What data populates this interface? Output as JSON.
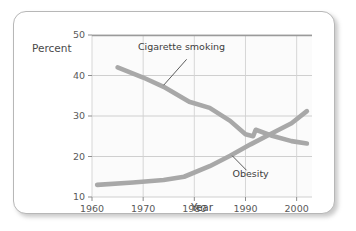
{
  "chart_data": {
    "type": "line",
    "title": "",
    "xlabel": "Year",
    "ylabel": "Percent",
    "xlim": [
      1960,
      2003
    ],
    "ylim": [
      10,
      50
    ],
    "xticks": [
      1960,
      1970,
      1980,
      1990,
      2000
    ],
    "yticks": [
      10,
      20,
      30,
      40,
      50
    ],
    "xtick_labels": [
      "1960",
      "1970",
      "1980",
      "1990",
      "2000"
    ],
    "ytick_labels": [
      "10",
      "20",
      "30",
      "40",
      "50"
    ],
    "grid": true,
    "legend_position": "inline-annotations",
    "line_color": "#a8a8a8",
    "series": [
      {
        "name": "Cigarette smoking",
        "label": "Cigarette smoking",
        "x": [
          1965,
          1970,
          1974,
          1979,
          1983,
          1987,
          1990,
          1991.5,
          1992,
          1995,
          1999,
          2002
        ],
        "values": [
          42.0,
          39.5,
          37.2,
          33.5,
          32.0,
          28.8,
          25.5,
          25.0,
          26.6,
          25.2,
          23.8,
          23.2
        ]
      },
      {
        "name": "Obesity",
        "label": "Obesity",
        "x": [
          1961,
          1968,
          1974,
          1978,
          1983,
          1987,
          1991,
          1995,
          1999,
          2002
        ],
        "values": [
          13.0,
          13.6,
          14.2,
          15.0,
          17.6,
          20.2,
          23.0,
          25.6,
          28.2,
          31.2
        ]
      }
    ],
    "annotations": [
      {
        "text": "Cigarette smoking",
        "label_x": 1977.5,
        "label_y": 46.2,
        "leader_from": [
          1978.5,
          44.0
        ],
        "leader_to": [
          1974.0,
          37.6
        ]
      },
      {
        "text": "Obesity",
        "label_x": 1991.0,
        "label_y": 15.0,
        "leader_from": [
          1990.2,
          16.6
        ],
        "leader_to": [
          1987.4,
          20.2
        ]
      }
    ]
  }
}
